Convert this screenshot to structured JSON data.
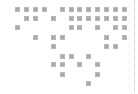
{
  "grid": {
    "columns": 13,
    "rows": 9,
    "cell_color": "#a9a9a9",
    "filled": [
      [
        0,
        1,
        2,
        3,
        5,
        6,
        7,
        8,
        9,
        10,
        11,
        12
      ],
      [
        1,
        2,
        4,
        6,
        7,
        8,
        9,
        10,
        11,
        12
      ],
      [
        0,
        6,
        7,
        9,
        11,
        12
      ],
      [
        2,
        4,
        5,
        10,
        12
      ],
      [
        4,
        10,
        11
      ],
      [
        5,
        6,
        8
      ],
      [
        4,
        5,
        7,
        9
      ],
      [
        5,
        9
      ],
      [
        8
      ]
    ]
  },
  "divider": {
    "style": "dotted",
    "color": "#c4c4c4"
  }
}
